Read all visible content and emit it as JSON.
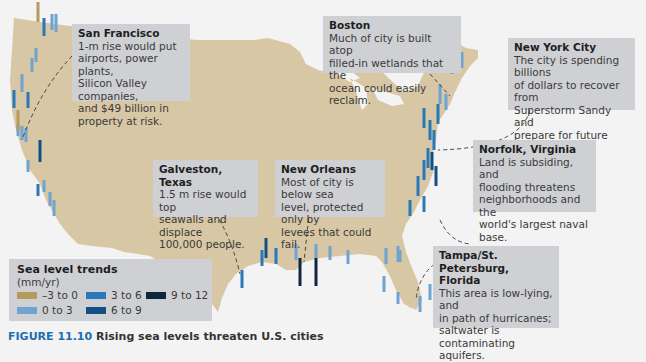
{
  "map": {
    "subject": "United States coastline sea level trends",
    "land_color": "#d8c7a4",
    "water_color": "#f4f4f4"
  },
  "callouts": [
    {
      "id": "san-francisco",
      "title": "San Francisco",
      "lines": [
        "1-m rise would put",
        "airports, power plants,",
        "Silicon Valley companies,",
        "and $49 billion in",
        "property at risk."
      ]
    },
    {
      "id": "boston",
      "title": "Boston",
      "lines": [
        "Much of city is built atop",
        "filled-in wetlands that the",
        "ocean could easily reclaim."
      ]
    },
    {
      "id": "new-york-city",
      "title": "New York City",
      "lines": [
        "The city is spending billions",
        "of dollars to recover from",
        "Superstorm Sandy and",
        "prepare for future flooding."
      ]
    },
    {
      "id": "norfolk",
      "title": "Norfolk, Virginia",
      "lines": [
        "Land is subsiding, and",
        "flooding threatens",
        "neighborhoods and the",
        "world's largest naval base."
      ]
    },
    {
      "id": "galveston",
      "title": "Galveston, Texas",
      "lines": [
        "1.5 m rise would top",
        "seawalls and displace",
        "100,000 people."
      ]
    },
    {
      "id": "new-orleans",
      "title": "New Orleans",
      "lines": [
        "Most of city is below sea",
        "level, protected only by",
        "levees that could fail."
      ]
    },
    {
      "id": "tampa",
      "title": "Tampa/St. Petersburg,",
      "title2": "Florida",
      "lines": [
        "This area is low-lying, and",
        "in path of hurricanes;",
        "saltwater is contaminating",
        "aquifers."
      ]
    }
  ],
  "legend": {
    "title": "Sea level trends",
    "unit": "(mm/yr)",
    "items": [
      {
        "label": "–3 to 0",
        "color": "#b59a5c"
      },
      {
        "label": "0 to 3",
        "color": "#6ea3d2"
      },
      {
        "label": "3 to 6",
        "color": "#2a78b8"
      },
      {
        "label": "6 to 9",
        "color": "#134f86"
      },
      {
        "label": "9 to 12",
        "color": "#0d2740"
      }
    ]
  },
  "caption": {
    "figure": "FIGURE 11.10",
    "text": "Rising sea levels threaten U.S. cities"
  }
}
